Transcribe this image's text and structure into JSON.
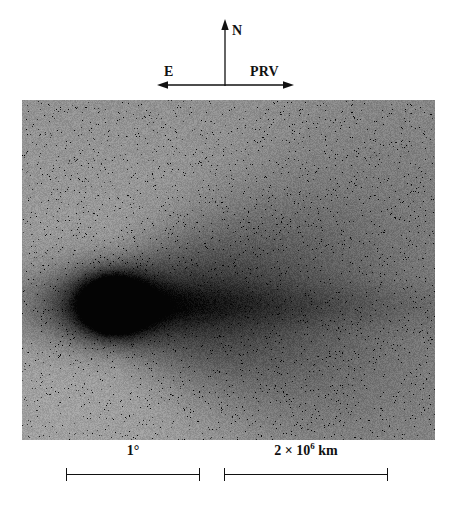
{
  "figure": {
    "kind": "astronomical-plate"
  },
  "compass": {
    "north_label": "N",
    "east_label": "E",
    "prv_label": "PRV",
    "north_arrow_icon": "arrow-up-icon",
    "east_arrow_icon": "arrow-left-icon",
    "prv_arrow_icon": "arrow-right-icon",
    "line_color": "#111111"
  },
  "plate": {
    "background_color": "#8c8c8c",
    "comet_color": "#0d0d0d",
    "halo_color": "#b4b4b4",
    "nucleus_x": 90,
    "nucleus_y": 205,
    "tail_direction": "right"
  },
  "scalebars": [
    {
      "name": "angular",
      "value": "1",
      "unit": "°",
      "caption_plain": "1°",
      "mantissa": "",
      "exponent": "",
      "suffix": ""
    },
    {
      "name": "linear",
      "value": "2",
      "unit": "km",
      "caption_plain": "2 × 10⁶ km",
      "mantissa": "2 × 10",
      "exponent": "6",
      "suffix": "km"
    }
  ],
  "chart_data": {
    "type": "image-plate",
    "title": "",
    "annotations": [
      "N",
      "E",
      "PRV",
      "1°",
      "2 × 10⁶ km"
    ],
    "scale_angular_deg": 1,
    "scale_linear_km": 2000000,
    "orientation": {
      "up": "N",
      "left": "E",
      "right": "PRV"
    }
  }
}
